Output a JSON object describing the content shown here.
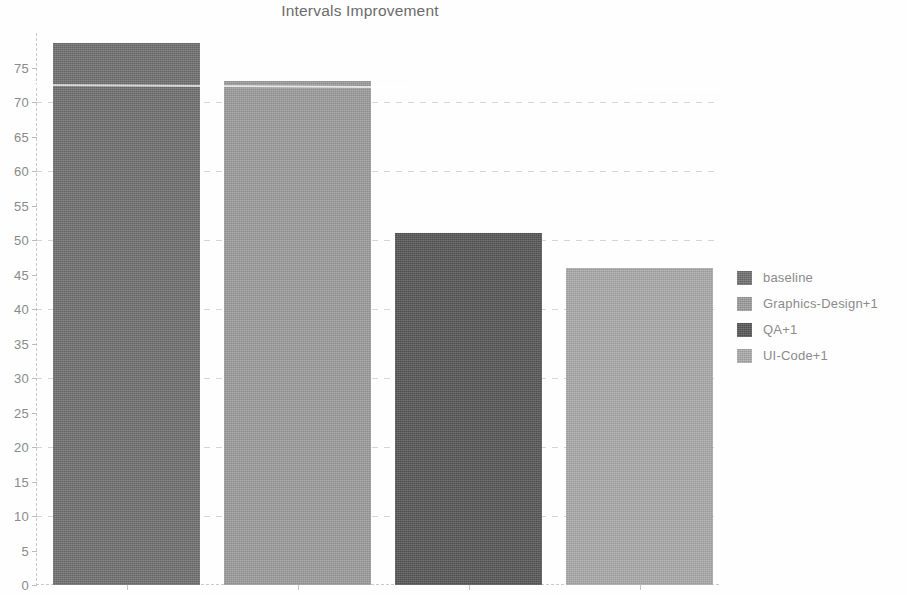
{
  "chart_data": {
    "type": "bar",
    "title": "Intervals Improvement",
    "xlabel": "",
    "ylabel": "",
    "categories": [
      "baseline",
      "Graphics-Design+1",
      "QA+1",
      "UI-Code+1"
    ],
    "values": [
      78.5,
      73,
      51,
      46
    ],
    "series": [
      {
        "name": "Intervals Improvement",
        "values": [
          78.5,
          73,
          51,
          46
        ]
      }
    ],
    "colors": [
      "#6e6e6e",
      "#9b9b9b",
      "#555555",
      "#a9a9a9"
    ],
    "ylim": [
      0,
      80
    ],
    "ytick_labels": [
      "0",
      "5",
      "10",
      "15",
      "20",
      "25",
      "30",
      "35",
      "40",
      "45",
      "50",
      "55",
      "60",
      "65",
      "70",
      "75"
    ],
    "ytick_values": [
      0,
      5,
      10,
      15,
      20,
      25,
      30,
      35,
      40,
      45,
      50,
      55,
      60,
      65,
      70,
      75
    ],
    "gridlines_at": [
      10,
      20,
      30,
      40,
      50,
      60,
      70
    ],
    "grid": true,
    "xtick_labels": [
      "",
      "",
      "",
      ""
    ],
    "legend": {
      "position": "right",
      "entries": [
        {
          "label": "baseline",
          "color": "#6e6e6e"
        },
        {
          "label": "Graphics-Design+1",
          "color": "#9b9b9b"
        },
        {
          "label": "QA+1",
          "color": "#555555"
        },
        {
          "label": "UI-Code+1",
          "color": "#a9a9a9"
        }
      ]
    }
  }
}
